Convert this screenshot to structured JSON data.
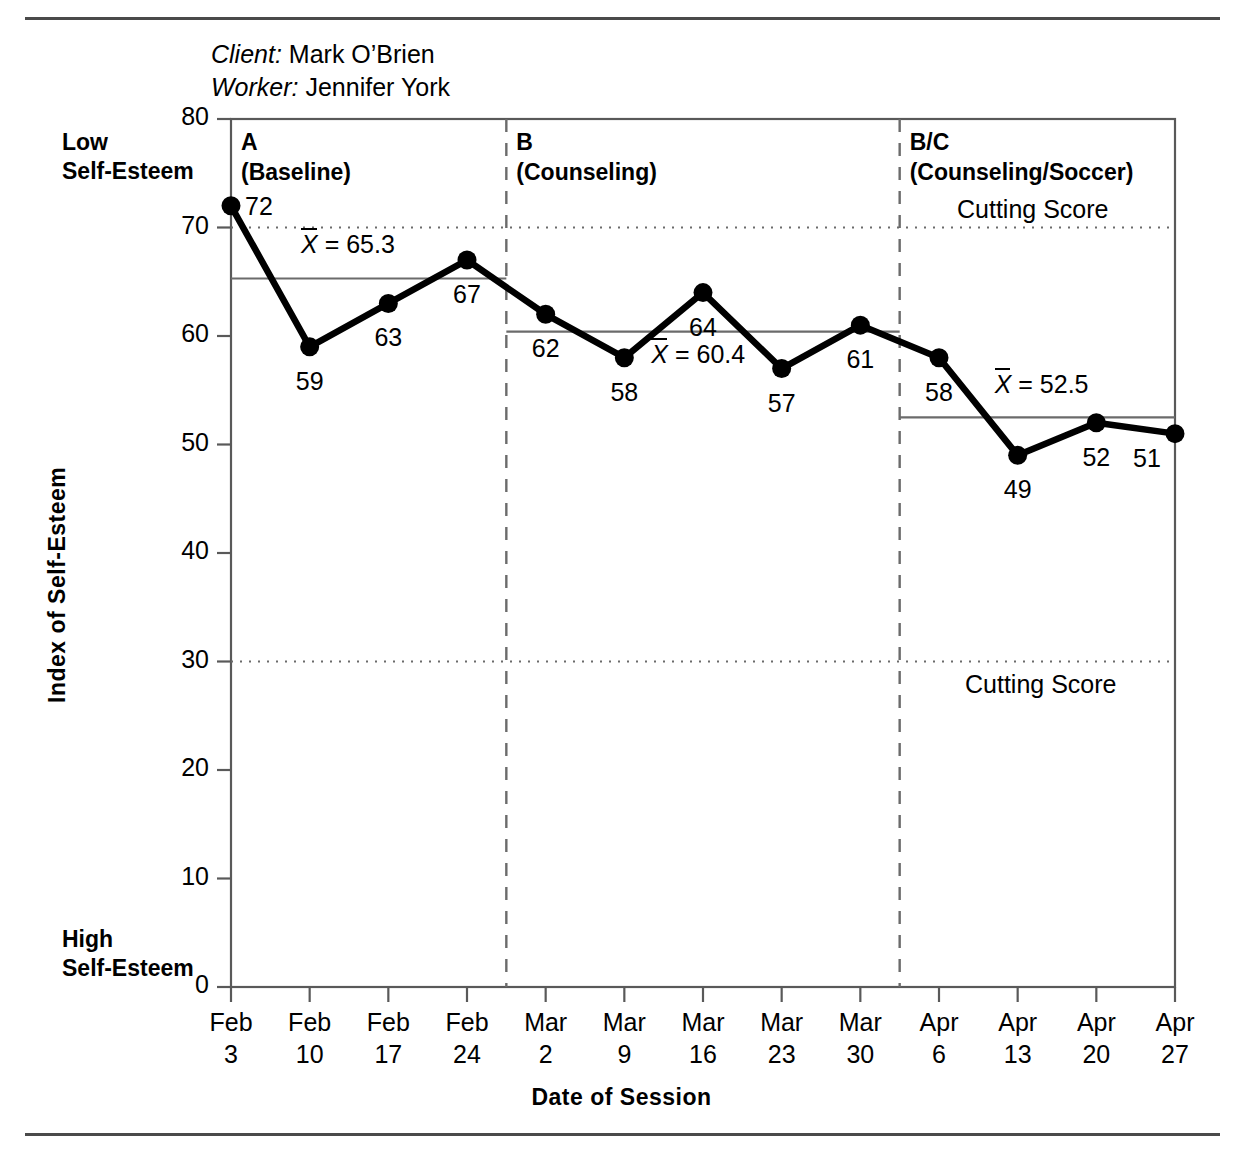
{
  "header": {
    "client_label": "Client:",
    "client_name": "Mark O’Brien",
    "worker_label": "Worker:",
    "worker_name": "Jennifer York"
  },
  "axis": {
    "y_title": "Index of Self-Esteem",
    "x_title": "Date of Session",
    "y_top_note_line1": "Low",
    "y_top_note_line2": "Self-Esteem",
    "y_bottom_note_line1": "High",
    "y_bottom_note_line2": "Self-Esteem"
  },
  "chart_data": {
    "type": "line",
    "title": "",
    "xlabel": "Date of Session",
    "ylabel": "Index of Self-Esteem",
    "ylim": [
      0,
      80
    ],
    "yticks": [
      0,
      10,
      20,
      30,
      40,
      50,
      60,
      70,
      80
    ],
    "grid": false,
    "legend_position": "none",
    "categories": [
      "Feb 3",
      "Feb 10",
      "Feb 17",
      "Feb 24",
      "Mar 2",
      "Mar 9",
      "Mar 16",
      "Mar 23",
      "Mar 30",
      "Apr 6",
      "Apr 13",
      "Apr 20",
      "Apr 27"
    ],
    "x_tick_months": [
      "Feb",
      "Feb",
      "Feb",
      "Feb",
      "Mar",
      "Mar",
      "Mar",
      "Mar",
      "Mar",
      "Apr",
      "Apr",
      "Apr",
      "Apr"
    ],
    "x_tick_days": [
      "3",
      "10",
      "17",
      "24",
      "2",
      "9",
      "16",
      "23",
      "30",
      "6",
      "13",
      "20",
      "27"
    ],
    "values": [
      72,
      59,
      63,
      67,
      62,
      58,
      64,
      57,
      61,
      58,
      49,
      52,
      51
    ],
    "point_labels": [
      "72",
      "59",
      "63",
      "67",
      "62",
      "58",
      "64",
      "57",
      "61",
      "58",
      "49",
      "52",
      "51"
    ],
    "series": [
      {
        "name": "Index of Self-Esteem",
        "values": [
          72,
          59,
          63,
          67,
          62,
          58,
          64,
          57,
          61,
          58,
          49,
          52,
          51
        ]
      }
    ],
    "phases": [
      {
        "id": "A",
        "label_line1": "A",
        "label_line2": "(Baseline)",
        "start_index": 0,
        "end_index": 3,
        "mean": 65.3,
        "mean_text": "= 65.3"
      },
      {
        "id": "B",
        "label_line1": "B",
        "label_line2": "(Counseling)",
        "start_index": 4,
        "end_index": 8,
        "mean": 60.4,
        "mean_text": "= 60.4"
      },
      {
        "id": "B/C",
        "label_line1": "B/C",
        "label_line2": "(Counseling/Soccer)",
        "start_index": 9,
        "end_index": 12,
        "mean": 52.5,
        "mean_text": "= 52.5"
      }
    ],
    "cutting_scores": [
      {
        "value": 70,
        "label": "Cutting Score"
      },
      {
        "value": 30,
        "label": "Cutting Score"
      }
    ],
    "mean_symbol": "X",
    "annotations": [
      "Low Self-Esteem",
      "High Self-Esteem"
    ]
  },
  "colors": {
    "line": "#000000",
    "frame": "#595959",
    "mean_line": "#6b6b6b",
    "divider": "#6b6b6b",
    "cutting": "#6b6b6b",
    "rule": "#4a4a4a"
  }
}
